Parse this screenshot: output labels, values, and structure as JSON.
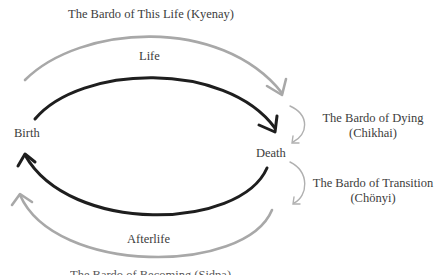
{
  "diagram": {
    "labels": {
      "bardo_this_life": "The Bardo of This Life (Kyenay)",
      "life": "Life",
      "birth": "Birth",
      "death": "Death",
      "bardo_dying": "The Bardo of Dying",
      "bardo_dying_sub": "(Chikhai)",
      "bardo_transition": "The Bardo of Transition",
      "bardo_transition_sub": "(Chönyi)",
      "afterlife": "Afterlife",
      "bottom_cut": "The Bardo of Becoming (Sidpa)"
    },
    "colors": {
      "black_arrow": "#1e1e1e",
      "gray_arrow": "#a8a8a8",
      "small_arrow": "#b0b0b0",
      "text": "#3c3c3c"
    }
  }
}
